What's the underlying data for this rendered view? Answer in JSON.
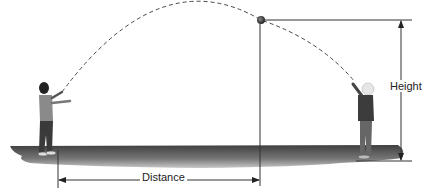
{
  "diagram": {
    "labels": {
      "distance": "Distance",
      "height": "Height"
    },
    "elements": {
      "ball": "ball at apex of trajectory",
      "trajectory": "dashed parabolic arc",
      "thrower": "child on left",
      "catcher": "child on right",
      "ground": "shadowed ground strip"
    },
    "colors": {
      "line": "#333333",
      "ground_dark": "#4a4a4a",
      "ground_light": "#b5b5b5",
      "ball": "#444444"
    }
  }
}
